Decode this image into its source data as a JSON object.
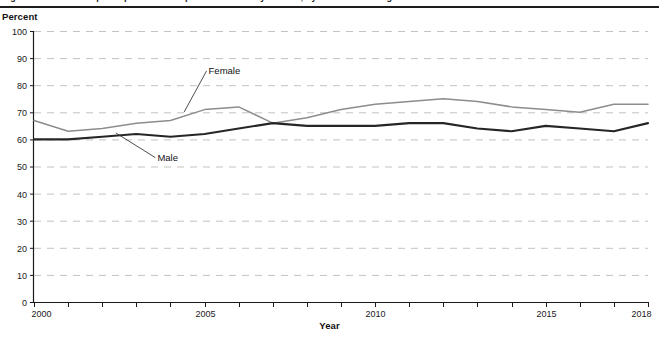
{
  "figure": {
    "title_clipped": "Figure 1. Labor force participation rate of persons 25 to 34 years old, by sex: 2000 through 2018",
    "ylabel": "Percent",
    "xlabel": "Year"
  },
  "chart_data": {
    "type": "line",
    "title": "",
    "xlabel": "Year",
    "ylabel": "Percent",
    "xlim": [
      2000,
      2018
    ],
    "ylim": [
      0,
      100
    ],
    "ytick_values": [
      0,
      10,
      20,
      30,
      40,
      50,
      60,
      70,
      80,
      90,
      100
    ],
    "ytick_labels": [
      "0",
      "10",
      "20",
      "30",
      "40",
      "50",
      "60",
      "70",
      "80",
      "90",
      "100"
    ],
    "xtick_values": [
      2000,
      2001,
      2002,
      2003,
      2004,
      2005,
      2006,
      2007,
      2008,
      2009,
      2010,
      2011,
      2012,
      2013,
      2014,
      2015,
      2016,
      2017,
      2018
    ],
    "xtick_labels_shown": [
      "2000",
      "2005",
      "2010",
      "2015",
      "2018"
    ],
    "grid": "horizontal-dashed",
    "legend": "inline-annotations",
    "x": [
      2000,
      2001,
      2002,
      2003,
      2004,
      2005,
      2006,
      2007,
      2008,
      2009,
      2010,
      2011,
      2012,
      2013,
      2014,
      2015,
      2016,
      2017,
      2018
    ],
    "series": [
      {
        "name": "Female",
        "color": "#8d8d8d",
        "values": [
          67,
          63,
          64,
          66,
          67,
          71,
          72,
          66,
          68,
          71,
          73,
          74,
          75,
          74,
          72,
          71,
          70,
          73,
          73
        ]
      },
      {
        "name": "Male",
        "color": "#262626",
        "values": [
          60,
          60,
          61,
          62,
          61,
          62,
          64,
          66,
          65,
          65,
          65,
          66,
          66,
          64,
          63,
          65,
          64,
          63,
          66
        ]
      }
    ],
    "annotations": [
      {
        "text": "Female",
        "x": 2005,
        "y": 86
      },
      {
        "text": "Male",
        "x": 2003.5,
        "y": 54
      }
    ]
  }
}
